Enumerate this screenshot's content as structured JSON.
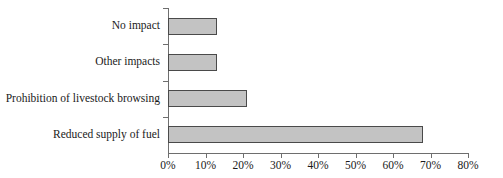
{
  "chart_data": {
    "type": "bar",
    "orientation": "horizontal",
    "title": "",
    "subtitle": "",
    "xlabel": "",
    "ylabel": "",
    "categories": [
      "No impact",
      "Other impacts",
      "Prohibition of livestock browsing",
      "Reduced supply of fuel"
    ],
    "values": [
      13,
      13,
      21,
      68
    ],
    "value_suffix": "%",
    "xlim": [
      0,
      80
    ],
    "xticks": [
      0,
      10,
      20,
      30,
      40,
      50,
      60,
      70,
      80
    ],
    "xtick_labels": [
      "0%",
      "10%",
      "20%",
      "30%",
      "40%",
      "50%",
      "60%",
      "70%",
      "80%"
    ],
    "grid": false,
    "legend": null,
    "legend_position": "none",
    "series": [
      {
        "name": "Share of respondents",
        "values": [
          13,
          13,
          21,
          68
        ]
      }
    ],
    "colors": {
      "bar_fill": "#c3c3c3",
      "bar_border": "#4a4a4a",
      "axis": "#6e6e6e",
      "text": "#1a1a1a",
      "background": "#ffffff"
    }
  }
}
